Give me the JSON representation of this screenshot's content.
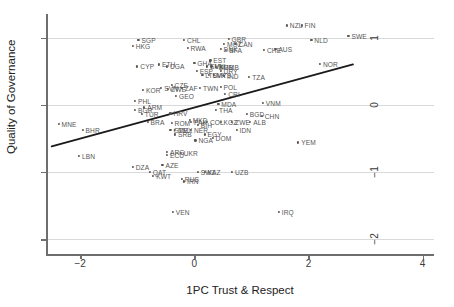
{
  "chart_data": {
    "type": "scatter",
    "title": "",
    "xlabel": "1PC Trust & Respect",
    "ylabel": "Quality of Governance",
    "xlim": [
      -2.6,
      4.2
    ],
    "ylim": [
      -2.25,
      1.35
    ],
    "xticks": [
      -2,
      0,
      2,
      4
    ],
    "xticklabels": [
      "−2",
      "0",
      "2",
      "4"
    ],
    "yticks": [
      1,
      0,
      -1,
      -2
    ],
    "yticklabels": [
      "1",
      "0",
      "−1",
      "−2"
    ],
    "grid": "horizontal gridlines at y = 1, 0, -1, -2",
    "legend": "none",
    "marker": "small filled circle with country ISO3 label to the right",
    "fit_line": {
      "type": "linear-fit",
      "x_start": -2.5,
      "y_start": -0.62,
      "x_end": 2.78,
      "y_end": 0.6,
      "slope": 0.231,
      "intercept": -0.042,
      "color": "#1a1a1a"
    },
    "points": [
      {
        "label": "NZL",
        "x": 1.62,
        "y": 1.18
      },
      {
        "label": "FIN",
        "x": 1.88,
        "y": 1.18
      },
      {
        "label": "SWE",
        "x": 2.7,
        "y": 1.03
      },
      {
        "label": "NLD",
        "x": 2.05,
        "y": 0.96
      },
      {
        "label": "GBR",
        "x": 0.6,
        "y": 0.98
      },
      {
        "label": "CHL",
        "x": -0.18,
        "y": 0.97
      },
      {
        "label": "SGP",
        "x": -0.98,
        "y": 0.96
      },
      {
        "label": "MOZ",
        "x": 0.52,
        "y": 0.9
      },
      {
        "label": "CAN",
        "x": 0.72,
        "y": 0.9
      },
      {
        "label": "HKG",
        "x": -1.08,
        "y": 0.88
      },
      {
        "label": "RWA",
        "x": -0.12,
        "y": 0.85
      },
      {
        "label": "DNK",
        "x": 0.46,
        "y": 0.83
      },
      {
        "label": "BFA",
        "x": 0.56,
        "y": 0.82
      },
      {
        "label": "CHE",
        "x": 1.22,
        "y": 0.82
      },
      {
        "label": "AUS",
        "x": 1.42,
        "y": 0.83
      },
      {
        "label": "EST",
        "x": 0.28,
        "y": 0.66
      },
      {
        "label": "NOR",
        "x": 2.2,
        "y": 0.61
      },
      {
        "label": "GHA",
        "x": 0.0,
        "y": 0.62
      },
      {
        "label": "ETH",
        "x": -0.62,
        "y": 0.6
      },
      {
        "label": "UGA",
        "x": -0.48,
        "y": 0.57
      },
      {
        "label": "CYP",
        "x": -1.0,
        "y": 0.57
      },
      {
        "label": "SVN",
        "x": 0.22,
        "y": 0.57
      },
      {
        "label": "MLI",
        "x": 0.3,
        "y": 0.57
      },
      {
        "label": "ZMB",
        "x": 0.38,
        "y": 0.56
      },
      {
        "label": "GMB",
        "x": 0.46,
        "y": 0.56
      },
      {
        "label": "ESP",
        "x": 0.04,
        "y": 0.5
      },
      {
        "label": "URY",
        "x": 0.46,
        "y": 0.5
      },
      {
        "label": "LTU",
        "x": 0.14,
        "y": 0.45
      },
      {
        "label": "SVK",
        "x": 0.26,
        "y": 0.45
      },
      {
        "label": "MYS",
        "x": 0.34,
        "y": 0.44
      },
      {
        "label": "IND",
        "x": 0.52,
        "y": 0.43
      },
      {
        "label": "TZA",
        "x": 0.96,
        "y": 0.42
      },
      {
        "label": "CZE",
        "x": -0.4,
        "y": 0.3
      },
      {
        "label": "SVN2",
        "x": -0.58,
        "y": 0.25
      },
      {
        "label": "ZWE",
        "x": -0.46,
        "y": 0.24
      },
      {
        "label": "ZAF",
        "x": -0.22,
        "y": 0.25
      },
      {
        "label": "TWN",
        "x": 0.1,
        "y": 0.25
      },
      {
        "label": "POL",
        "x": 0.46,
        "y": 0.27
      },
      {
        "label": "KOR",
        "x": -0.9,
        "y": 0.22
      },
      {
        "label": "GEO",
        "x": -0.32,
        "y": 0.13
      },
      {
        "label": "CRI",
        "x": 0.54,
        "y": 0.16
      },
      {
        "label": "PHL",
        "x": -1.04,
        "y": 0.06
      },
      {
        "label": "VNM",
        "x": 1.2,
        "y": 0.03
      },
      {
        "label": "MDA",
        "x": 0.42,
        "y": 0.01
      },
      {
        "label": "ARM",
        "x": -0.88,
        "y": -0.04
      },
      {
        "label": "BGR",
        "x": -1.04,
        "y": -0.08
      },
      {
        "label": "THA",
        "x": 0.38,
        "y": -0.08
      },
      {
        "label": "HRV",
        "x": -0.42,
        "y": -0.13
      },
      {
        "label": "TUR",
        "x": -0.92,
        "y": -0.14
      },
      {
        "label": "BGD",
        "x": 0.92,
        "y": -0.14
      },
      {
        "label": "CHN",
        "x": 1.18,
        "y": -0.17
      },
      {
        "label": "MNE",
        "x": -2.38,
        "y": -0.29
      },
      {
        "label": "BRA",
        "x": -0.82,
        "y": -0.25
      },
      {
        "label": "ROM",
        "x": -0.4,
        "y": -0.27
      },
      {
        "label": "MKD",
        "x": -0.08,
        "y": -0.23
      },
      {
        "label": "PAK",
        "x": -0.06,
        "y": -0.26
      },
      {
        "label": "COL",
        "x": 0.22,
        "y": -0.25
      },
      {
        "label": "KGZ",
        "x": 0.46,
        "y": -0.26
      },
      {
        "label": "ZWE2",
        "x": 0.66,
        "y": -0.26
      },
      {
        "label": "ALB",
        "x": 0.98,
        "y": -0.26
      },
      {
        "label": "BIH",
        "x": 0.06,
        "y": -0.3
      },
      {
        "label": "BHR",
        "x": -1.96,
        "y": -0.38
      },
      {
        "label": "GTM",
        "x": -0.42,
        "y": -0.38
      },
      {
        "label": "MEX",
        "x": -0.34,
        "y": -0.37
      },
      {
        "label": "NER",
        "x": -0.06,
        "y": -0.37
      },
      {
        "label": "IDN",
        "x": 0.74,
        "y": -0.38
      },
      {
        "label": "SRB",
        "x": -0.34,
        "y": -0.44
      },
      {
        "label": "EGY",
        "x": 0.18,
        "y": -0.44
      },
      {
        "label": "DOM",
        "x": 0.32,
        "y": -0.49
      },
      {
        "label": "NGA",
        "x": 0.02,
        "y": -0.53
      },
      {
        "label": "YEM",
        "x": 1.82,
        "y": -0.56
      },
      {
        "label": "LBN",
        "x": -2.02,
        "y": -0.76
      },
      {
        "label": "UKR",
        "x": -0.24,
        "y": -0.72
      },
      {
        "label": "ARG",
        "x": -0.48,
        "y": -0.7
      },
      {
        "label": "ECU",
        "x": -0.48,
        "y": -0.75
      },
      {
        "label": "DZA",
        "x": -1.08,
        "y": -0.92
      },
      {
        "label": "AZE",
        "x": -0.56,
        "y": -0.9
      },
      {
        "label": "QAT",
        "x": -0.78,
        "y": -1.0
      },
      {
        "label": "SWZ",
        "x": 0.06,
        "y": -1.0
      },
      {
        "label": "KAZ",
        "x": 0.18,
        "y": -1.0
      },
      {
        "label": "UZB",
        "x": 0.66,
        "y": -1.0
      },
      {
        "label": "KWT",
        "x": -0.72,
        "y": -1.06
      },
      {
        "label": "RUS",
        "x": -0.22,
        "y": -1.1
      },
      {
        "label": "IRN",
        "x": -0.18,
        "y": -1.14
      },
      {
        "label": "VEN",
        "x": -0.38,
        "y": -1.59
      },
      {
        "label": "IRQ",
        "x": 1.48,
        "y": -1.59
      }
    ]
  },
  "axes": {
    "y_title": "Quality of Governance",
    "x_title": "1PC Trust & Respect"
  }
}
